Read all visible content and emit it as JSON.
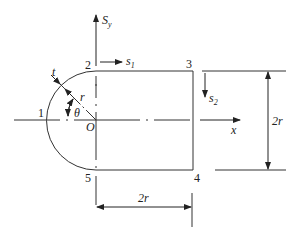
{
  "figure": {
    "type": "thin-walled open section (semicircle + rectangle) with shear flow coordinates",
    "points": [
      {
        "id": "p1",
        "label": "1"
      },
      {
        "id": "p2",
        "label": "2"
      },
      {
        "id": "p3",
        "label": "3"
      },
      {
        "id": "p4",
        "label": "4"
      },
      {
        "id": "p5",
        "label": "5"
      }
    ],
    "origin_label": "O",
    "axes": {
      "vertical_label": "S",
      "vertical_sub": "y",
      "horizontal_label": "x"
    },
    "coordinates": {
      "s1_label": "s",
      "s1_sub": "1",
      "s2_label": "s",
      "s2_sub": "2"
    },
    "annotations": {
      "thickness": "t",
      "radius": "r",
      "angle": "θ"
    },
    "dimensions": {
      "height": "2r",
      "width": "2r"
    },
    "colors": {
      "line": "#333333",
      "background": "#ffffff"
    }
  }
}
